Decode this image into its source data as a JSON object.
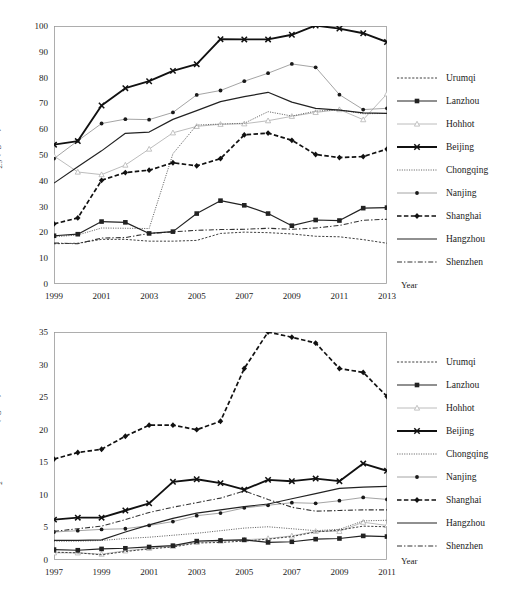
{
  "figure": {
    "background": "#ffffff",
    "ink": "#1a1a1a"
  },
  "chart_data": [
    {
      "id": "pm25",
      "type": "line",
      "title": "",
      "xlabel": "Year",
      "ylabel": "PM2.5 (ug/m3)",
      "ylabel_html": "PM<sub>2.5</sub> (ug/m<sup>3</sup>)",
      "x": [
        1999,
        2000,
        2001,
        2002,
        2003,
        2004,
        2005,
        2006,
        2007,
        2008,
        2009,
        2010,
        2011,
        2012,
        2013
      ],
      "xlim": [
        1999,
        2013
      ],
      "ylim": [
        0,
        100
      ],
      "yticks": [
        0,
        10,
        20,
        30,
        40,
        50,
        60,
        70,
        80,
        90,
        100
      ],
      "xticks": [
        1999,
        2001,
        2003,
        2005,
        2007,
        2009,
        2011,
        2013
      ],
      "grid": false,
      "legend_position": "right",
      "series": [
        {
          "name": "Urumqi",
          "style": "dotted-fine",
          "marker": "none",
          "values": [
            15.6,
            15.8,
            17.3,
            17.3,
            16.6,
            16.6,
            16.9,
            19.6,
            20.1,
            19.9,
            19.4,
            18.5,
            18.3,
            17.2,
            15.8
          ]
        },
        {
          "name": "Lanzhou",
          "style": "solid",
          "marker": "square",
          "values": [
            18.7,
            19.3,
            24.2,
            23.9,
            19.6,
            20.3,
            27.3,
            32.3,
            30.5,
            27.3,
            22.6,
            24.8,
            24.6,
            29.4,
            29.6
          ]
        },
        {
          "name": "Hohhot",
          "style": "solid-light",
          "marker": "triangle",
          "values": [
            49.6,
            43.4,
            42.4,
            46.1,
            52.3,
            58.6,
            61.1,
            61.9,
            62.1,
            63.3,
            65.0,
            66.5,
            67.6,
            63.7,
            73.7
          ]
        },
        {
          "name": "Beijing",
          "style": "solid-bold",
          "marker": "cross",
          "values": [
            54.0,
            55.4,
            69.2,
            75.9,
            78.6,
            82.6,
            85.2,
            94.9,
            94.8,
            94.8,
            96.6,
            100.2,
            99.0,
            97.2,
            93.8
          ]
        },
        {
          "name": "Chongqing",
          "style": "dotted",
          "marker": "none",
          "values": [
            18.3,
            19.0,
            21.7,
            21.6,
            21.5,
            50.5,
            61.6,
            62.0,
            62.3,
            66.8,
            65.1,
            67.0,
            67.5,
            66.0,
            66.1
          ]
        },
        {
          "name": "Nanjing",
          "style": "solid-thin",
          "marker": "dot",
          "values": [
            48.6,
            55.5,
            62.2,
            63.9,
            63.7,
            66.5,
            73.3,
            75.0,
            78.6,
            81.7,
            85.3,
            84.0,
            73.4,
            67.6,
            68.1
          ]
        },
        {
          "name": "Shanghai",
          "style": "dashed-bold",
          "marker": "diamond",
          "values": [
            23.3,
            25.6,
            40.2,
            43.2,
            44.1,
            47.0,
            45.8,
            48.6,
            57.8,
            58.5,
            55.7,
            50.2,
            49.0,
            49.4,
            52.3
          ]
        },
        {
          "name": "Hangzhou",
          "style": "solid",
          "marker": "none",
          "values": [
            39.1,
            45.4,
            51.6,
            58.4,
            58.9,
            63.8,
            67.2,
            70.7,
            72.6,
            74.3,
            70.5,
            68.1,
            67.4,
            66.3,
            66.1
          ]
        },
        {
          "name": "Shenzhen",
          "style": "dashdot",
          "marker": "none",
          "values": [
            15.9,
            15.6,
            17.8,
            18.0,
            19.6,
            20.2,
            20.8,
            21.1,
            21.2,
            21.6,
            21.2,
            21.7,
            22.7,
            24.7,
            25.1
          ]
        }
      ]
    },
    {
      "id": "no2",
      "type": "line",
      "title": "",
      "xlabel": "Year",
      "ylabel": "NO2 Concentration (ug/m3)",
      "ylabel_html": "NO<sub>2</sub> Concentration (ug/m<sup>3</sup>)",
      "x": [
        1997,
        1998,
        1999,
        2000,
        2001,
        2002,
        2003,
        2004,
        2005,
        2006,
        2007,
        2008,
        2009,
        2010,
        2011
      ],
      "xlim": [
        1997,
        2011
      ],
      "ylim": [
        0,
        35
      ],
      "yticks": [
        0,
        5,
        10,
        15,
        20,
        25,
        30,
        35
      ],
      "xticks": [
        1997,
        1999,
        2001,
        2003,
        2005,
        2007,
        2009,
        2011
      ],
      "grid": false,
      "legend_position": "right",
      "series": [
        {
          "name": "Urumqi",
          "style": "dotted-fine",
          "marker": "none",
          "values": [
            1.2,
            1.1,
            0.8,
            1.3,
            1.7,
            2.0,
            2.6,
            2.7,
            2.9,
            3.2,
            3.6,
            4.3,
            4.6,
            5.2,
            5.1
          ]
        },
        {
          "name": "Lanzhou",
          "style": "solid",
          "marker": "square",
          "values": [
            1.6,
            1.5,
            1.7,
            1.8,
            2.0,
            2.2,
            2.9,
            3.0,
            3.1,
            2.7,
            2.8,
            3.2,
            3.3,
            3.7,
            3.6
          ]
        },
        {
          "name": "Hohhot",
          "style": "solid-light",
          "marker": "triangle",
          "values": [
            1.1,
            1.1,
            0.9,
            1.4,
            1.8,
            2.1,
            2.7,
            2.9,
            3.1,
            3.3,
            3.7,
            4.4,
            4.4,
            5.8,
            5.3
          ]
        },
        {
          "name": "Beijing",
          "style": "solid-bold",
          "marker": "cross",
          "values": [
            6.2,
            6.5,
            6.5,
            7.6,
            8.7,
            12.0,
            12.4,
            11.8,
            10.8,
            12.3,
            12.1,
            12.5,
            12.1,
            14.8,
            13.7
          ]
        },
        {
          "name": "Chongqing",
          "style": "dotted",
          "marker": "none",
          "values": [
            2.9,
            2.9,
            3.0,
            3.3,
            3.5,
            3.8,
            4.1,
            4.5,
            4.9,
            5.1,
            4.8,
            4.5,
            4.7,
            6.0,
            6.1
          ]
        },
        {
          "name": "Nanjing",
          "style": "solid-thin",
          "marker": "dot",
          "values": [
            4.3,
            4.5,
            4.7,
            4.8,
            5.3,
            5.9,
            6.8,
            7.2,
            8.0,
            8.4,
            8.8,
            8.7,
            9.1,
            9.6,
            9.3
          ]
        },
        {
          "name": "Shanghai",
          "style": "dashed-bold",
          "marker": "diamond",
          "values": [
            15.5,
            16.5,
            17.0,
            19.0,
            20.7,
            20.7,
            20.0,
            21.3,
            29.4,
            35.0,
            34.2,
            33.3,
            29.4,
            28.8,
            25.1
          ]
        },
        {
          "name": "Hangzhou",
          "style": "solid",
          "marker": "none",
          "values": [
            3.0,
            3.0,
            3.1,
            4.3,
            5.4,
            6.4,
            7.2,
            7.7,
            8.2,
            8.6,
            9.4,
            10.2,
            11.0,
            11.2,
            11.3
          ]
        },
        {
          "name": "Shenzhen",
          "style": "dashdot",
          "marker": "none",
          "values": [
            4.4,
            4.8,
            5.2,
            6.2,
            7.3,
            8.1,
            8.8,
            9.5,
            10.6,
            9.3,
            8.1,
            7.5,
            7.6,
            7.7,
            7.7
          ]
        }
      ]
    }
  ],
  "legend": {
    "entries": [
      {
        "label": "Urumqi"
      },
      {
        "label": "Lanzhou"
      },
      {
        "label": "Hohhot"
      },
      {
        "label": "Beijing"
      },
      {
        "label": "Chongqing"
      },
      {
        "label": "Nanjing"
      },
      {
        "label": "Shanghai"
      },
      {
        "label": "Hangzhou"
      },
      {
        "label": "Shenzhen"
      }
    ]
  },
  "axis_titles": {
    "year": "Year"
  }
}
